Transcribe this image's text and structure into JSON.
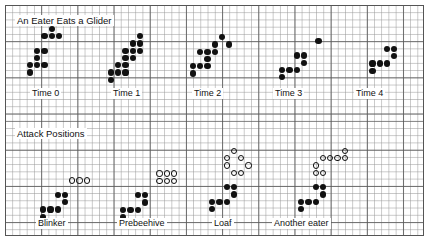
{
  "figure": {
    "title": "An Eater Eats a Glider",
    "section2_title": "Attack Positions",
    "background": "#ffffff",
    "cell_fill": "#111111",
    "grid_minor_color": "#969696",
    "grid_major_color": "#5a5a5a",
    "grid_cell_px": 7.24,
    "grid_major_every": 5
  },
  "top_section": {
    "label": "An Eater Eats a Glider",
    "frames": [
      {
        "label": "Time 0",
        "label_x": 30,
        "label_y": 88,
        "origin_x": 27,
        "origin_y": 26,
        "alive": [
          [
            3,
            0
          ],
          [
            2,
            1
          ],
          [
            3,
            1
          ],
          [
            4,
            1
          ],
          [
            1,
            3
          ],
          [
            2,
            3
          ],
          [
            1,
            4
          ],
          [
            0,
            5
          ],
          [
            1,
            5
          ],
          [
            2,
            5
          ],
          [
            0,
            6
          ]
        ],
        "open": []
      },
      {
        "label": "Time 1",
        "label_x": 111,
        "label_y": 88,
        "origin_x": 108,
        "origin_y": 26,
        "alive": [
          [
            4,
            1
          ],
          [
            3,
            2
          ],
          [
            4,
            2
          ],
          [
            2,
            3
          ],
          [
            3,
            3
          ],
          [
            4,
            3
          ],
          [
            2,
            4
          ],
          [
            3,
            4
          ],
          [
            1,
            5
          ],
          [
            2,
            5
          ],
          [
            0,
            6
          ],
          [
            1,
            6
          ],
          [
            2,
            6
          ],
          [
            0,
            7
          ]
        ],
        "open": []
      },
      {
        "label": "Time 2",
        "label_x": 192,
        "label_y": 88,
        "origin_x": 190,
        "origin_y": 27,
        "alive": [
          [
            4,
            1
          ],
          [
            5,
            2
          ],
          [
            3,
            2
          ],
          [
            2,
            3
          ],
          [
            3,
            3
          ],
          [
            1,
            3
          ],
          [
            2,
            4
          ],
          [
            0,
            5
          ],
          [
            1,
            5
          ],
          [
            2,
            5
          ],
          [
            0,
            6
          ]
        ],
        "open": []
      },
      {
        "label": "Time 3",
        "label_x": 273,
        "label_y": 88,
        "origin_x": 272,
        "origin_y": 38,
        "alive": [
          [
            6,
            0
          ],
          [
            3,
            2
          ],
          [
            4,
            2
          ],
          [
            4,
            3
          ],
          [
            1,
            4
          ],
          [
            2,
            4
          ],
          [
            3,
            4
          ],
          [
            1,
            5
          ]
        ],
        "open": []
      },
      {
        "label": "Time 4",
        "label_x": 354,
        "label_y": 88,
        "origin_x": 355,
        "origin_y": 46,
        "alive": [
          [
            4,
            0
          ],
          [
            5,
            0
          ],
          [
            5,
            1
          ],
          [
            2,
            2
          ],
          [
            3,
            2
          ],
          [
            4,
            2
          ],
          [
            2,
            3
          ]
        ],
        "open": []
      }
    ]
  },
  "bottom_section": {
    "label": "Attack Positions",
    "frames": [
      {
        "label": "Blinker",
        "label_x": 36,
        "label_y": 218,
        "origin_x": 33,
        "origin_y": 163,
        "alive": [
          [
            3,
            4
          ],
          [
            4,
            4
          ],
          [
            4,
            5
          ],
          [
            1,
            6
          ],
          [
            2,
            6
          ],
          [
            3,
            6
          ],
          [
            1,
            7
          ]
        ],
        "open": [
          [
            5,
            2
          ],
          [
            6,
            2
          ],
          [
            7,
            2
          ]
        ]
      },
      {
        "label": "Prebeehive",
        "label_x": 117,
        "label_y": 218,
        "origin_x": 113,
        "origin_y": 156,
        "alive": [
          [
            3,
            5
          ],
          [
            4,
            5
          ],
          [
            4,
            6
          ],
          [
            1,
            7
          ],
          [
            2,
            7
          ],
          [
            3,
            7
          ],
          [
            1,
            8
          ]
        ],
        "open": [
          [
            6,
            2
          ],
          [
            7,
            2
          ],
          [
            8,
            2
          ],
          [
            6,
            3
          ],
          [
            7,
            3
          ],
          [
            8,
            3
          ]
        ]
      },
      {
        "label": "Loaf",
        "label_x": 212,
        "label_y": 218,
        "origin_x": 202,
        "origin_y": 148,
        "alive": [
          [
            3,
            5
          ],
          [
            4,
            5
          ],
          [
            4,
            6
          ],
          [
            1,
            7
          ],
          [
            2,
            7
          ],
          [
            3,
            7
          ],
          [
            1,
            8
          ]
        ],
        "open": [
          [
            4,
            0
          ],
          [
            3,
            1
          ],
          [
            5,
            1
          ],
          [
            3,
            2
          ],
          [
            6,
            2
          ],
          [
            4,
            3
          ],
          [
            5,
            3
          ]
        ]
      },
      {
        "label": "Another eater",
        "label_x": 272,
        "label_y": 218,
        "origin_x": 291,
        "origin_y": 148,
        "alive": [
          [
            3,
            5
          ],
          [
            4,
            5
          ],
          [
            4,
            6
          ],
          [
            1,
            7
          ],
          [
            2,
            7
          ],
          [
            3,
            7
          ],
          [
            1,
            8
          ]
        ],
        "open": [
          [
            7,
            0
          ],
          [
            4,
            1
          ],
          [
            5,
            1
          ],
          [
            6,
            1
          ],
          [
            7,
            1
          ],
          [
            3,
            2
          ],
          [
            3,
            3
          ],
          [
            4,
            3
          ]
        ]
      }
    ]
  }
}
